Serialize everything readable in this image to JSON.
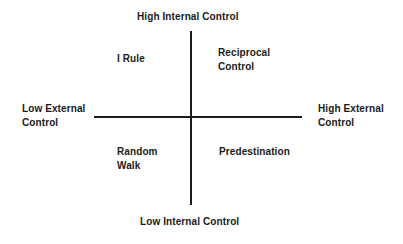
{
  "diagram": {
    "type": "quadrant-diagram",
    "axes": {
      "vertical": {
        "name": "Internal Control",
        "top_label": "High Internal Control",
        "bottom_label": "Low Internal Control"
      },
      "horizontal": {
        "name": "External Control",
        "left_label": "Low External\nControl",
        "right_label": "High External\nControl"
      },
      "line_color": "#1c1c1c"
    },
    "quadrants": [
      {
        "position": "upper-left",
        "label": "I Rule",
        "internal_control": "high",
        "external_control": "low"
      },
      {
        "position": "upper-right",
        "label": "Reciprocal\nControl",
        "internal_control": "high",
        "external_control": "high"
      },
      {
        "position": "lower-left",
        "label": "Random\nWalk",
        "internal_control": "low",
        "external_control": "low"
      },
      {
        "position": "lower-right",
        "label": "Predestination",
        "internal_control": "low",
        "external_control": "high"
      }
    ],
    "background_color": "#ffffff",
    "text_color": "#1a1a1a"
  }
}
